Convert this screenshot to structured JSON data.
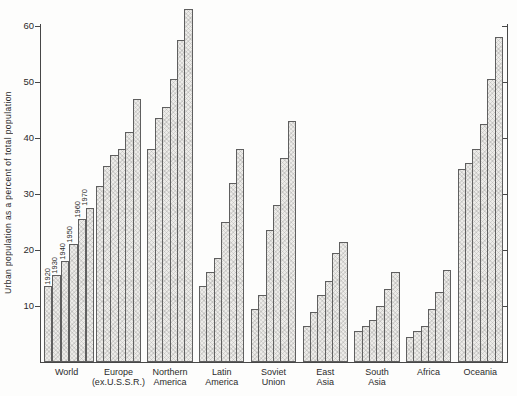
{
  "chart_data": {
    "type": "bar",
    "title": "",
    "ylabel": "Urban population as a percent of total population",
    "xlabel": "",
    "y_ticks": [
      10,
      20,
      30,
      40,
      50,
      60
    ],
    "ylim": [
      0,
      64
    ],
    "grid": false,
    "legend_position": "none",
    "series_note": "six bars per region = years 1920-1970; year labels drawn only over the World group",
    "years": [
      "1920",
      "1930",
      "1940",
      "1950",
      "1960",
      "1970"
    ],
    "categories": [
      "World",
      "Europe (ex.U.S.S.R.)",
      "Northern America",
      "Latin America",
      "Soviet Union",
      "East Asia",
      "South Asia",
      "Africa",
      "Oceania"
    ],
    "groups": [
      {
        "label_lines": [
          "World"
        ],
        "values": [
          13.5,
          15.5,
          18,
          21,
          25.5,
          27.5
        ]
      },
      {
        "label_lines": [
          "Europe",
          "(ex.U.S.S.R.)"
        ],
        "values": [
          31.5,
          35,
          37,
          38,
          41,
          47
        ]
      },
      {
        "label_lines": [
          "Northern",
          "America"
        ],
        "values": [
          38,
          43.5,
          45.5,
          50.5,
          57.5,
          63
        ]
      },
      {
        "label_lines": [
          "Latin",
          "America"
        ],
        "values": [
          13.5,
          16,
          18.5,
          25,
          32,
          38
        ]
      },
      {
        "label_lines": [
          "Soviet",
          "Union"
        ],
        "values": [
          9.5,
          12,
          23.5,
          28,
          36.5,
          43
        ]
      },
      {
        "label_lines": [
          "East",
          "Asia"
        ],
        "values": [
          6.5,
          9,
          12,
          14.5,
          19.5,
          21.5
        ]
      },
      {
        "label_lines": [
          "South",
          "Asia"
        ],
        "values": [
          5.5,
          6.5,
          7.5,
          10,
          13,
          16
        ]
      },
      {
        "label_lines": [
          "Africa"
        ],
        "values": [
          4.5,
          5.5,
          6.5,
          9.5,
          12.5,
          16.5
        ]
      },
      {
        "label_lines": [
          "Oceania"
        ],
        "values": [
          34.5,
          35.5,
          38,
          42.5,
          50.5,
          58
        ]
      }
    ],
    "colors": {
      "background": "#fdfdfc",
      "axis": "#474747",
      "bar_fill": "#ecebe8",
      "bar_outline": "#5f5f5f",
      "text": "#2b2b2b"
    }
  }
}
